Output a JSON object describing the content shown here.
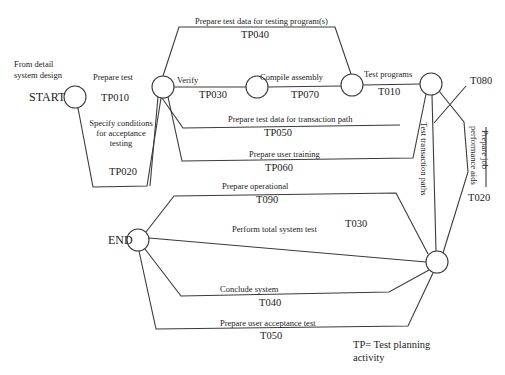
{
  "diagram": {
    "type": "activity-network",
    "labels": {
      "source_note_line1": "From detail",
      "source_note_line2": "system design",
      "start": "START",
      "end": "END",
      "legend_line1": "TP= Test planning",
      "legend_line2": "activity"
    },
    "activities": [
      {
        "id": "tp010",
        "name": "Prepare test",
        "code": "TP010"
      },
      {
        "id": "tp020",
        "name_lines": [
          "Specify conditions",
          "for acceptance",
          "testing"
        ],
        "code": "TP020"
      },
      {
        "id": "tp030",
        "name": "Verify",
        "code": "TP030"
      },
      {
        "id": "tp040",
        "name": "Prepare test data for testing program(s)",
        "code": "TP040"
      },
      {
        "id": "tp070",
        "name": "Compile assembly",
        "code": "TP070"
      },
      {
        "id": "t010",
        "name": "Test programs",
        "code": "T010"
      },
      {
        "id": "tp050",
        "name": "Prepare test data for transaction path",
        "code": "TP050"
      },
      {
        "id": "tp060",
        "name": "Prepare user training",
        "code": "TP060"
      },
      {
        "id": "t_paths",
        "name": "Test transaction paths",
        "code": ""
      },
      {
        "id": "t080",
        "name": "",
        "code": "T080"
      },
      {
        "id": "t020",
        "name_lines": [
          "Prepare job",
          "performance aids"
        ],
        "code": "T020"
      },
      {
        "id": "t090",
        "name": "Prepare operational",
        "code": "T090"
      },
      {
        "id": "t030",
        "name": "Perform total system test",
        "code": "T030"
      },
      {
        "id": "t040",
        "name": "Conclude system",
        "code": "T040"
      },
      {
        "id": "t050",
        "name": "Prepare user acceptance test",
        "code": "T050"
      }
    ]
  }
}
